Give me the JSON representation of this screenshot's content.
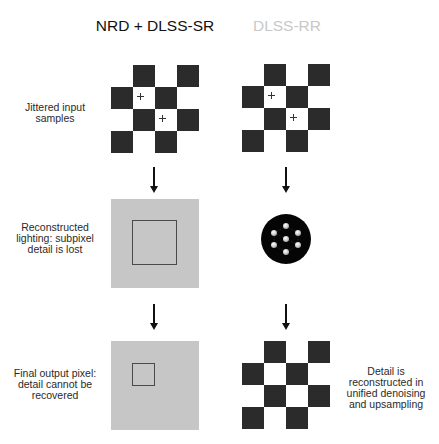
{
  "columns": [
    {
      "title": "NRD + DLSS-SR",
      "title_color": "#111111"
    },
    {
      "title": "DLSS-RR",
      "title_color": "#c8c8c8"
    }
  ],
  "row_labels": {
    "input": "Jittered input samples",
    "reconstructed": "Reconstructed lighting: subpixel detail is lost",
    "final": "Final output pixel: detail cannot be recovered",
    "rr_note": "Detail is reconstructed in unified denoising and upsampling"
  },
  "row_label_lines": {
    "input": [
      "Jittered input",
      "samples"
    ],
    "reconstructed": [
      "Reconstructed",
      "lighting: subpixel",
      "detail is lost"
    ],
    "final": [
      "Final output pixel:",
      "detail cannot be",
      "recovered"
    ],
    "rr_note": [
      "Detail is",
      "reconstructed in",
      "unified denoising",
      "and upsampling"
    ]
  },
  "checkerboard": {
    "grid": 4,
    "dark_cells": [
      [
        0,
        1
      ],
      [
        0,
        3
      ],
      [
        1,
        0
      ],
      [
        1,
        2
      ],
      [
        2,
        1
      ],
      [
        2,
        3
      ],
      [
        3,
        0
      ],
      [
        3,
        2
      ]
    ],
    "sample_marks": [
      [
        1,
        1
      ],
      [
        2,
        2
      ]
    ]
  },
  "stages": {
    "nrd_dlss_sr": [
      "checkerboard-with-samples",
      "gray-pixel-with-large-detail-outline",
      "gray-pixel-with-small-detail-outline"
    ],
    "dlss_rr": [
      "checkerboard-with-samples",
      "neural-network-icon",
      "reconstructed-checkerboard"
    ]
  },
  "colors": {
    "dark_cell": "#2b2b2b",
    "gray_pixel": "#c6c6c6",
    "outline": "#4a4a4a",
    "arrow": "#111111"
  }
}
